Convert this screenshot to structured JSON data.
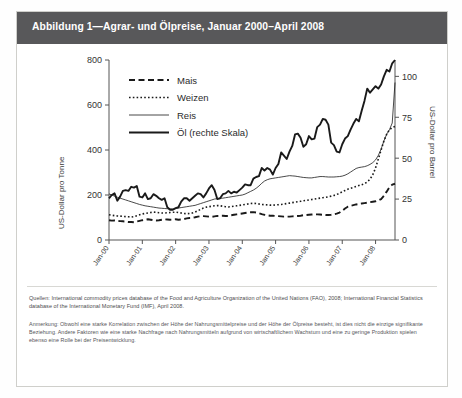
{
  "figure": {
    "title": "Abbildung 1—Agrar- und Ölpreise, Januar 2000–April 2008",
    "source_label": "Quellen:",
    "source_text": "Quellen:  International commodity prices database of the Food and Agriculture Organization of the United Nations (FAO), 2008; International Financial Statistics database of the International Monetary Fund (IMF), April 2008.",
    "note_text": "Anmerkung:  Obwohl eine starke Korrelation zwischen der Höhe der Nahrungsmittelpreise und der Höhe der Ölpreise besteht, ist dies nicht die einzige signifikante Beziehung. Andere Faktoren wie eine starke Nachfrage nach Nahrungsmitteln aufgrund von wirtschaftlichem Wachstum und eine zu geringe Produktion spielen ebenso eine Rolle bei der Preisentwicklung."
  },
  "chart_data": {
    "type": "line",
    "title": "Abbildung 1—Agrar- und Ölpreise, Januar 2000–April 2008",
    "xlabel": "",
    "ylabel": "US-Dollar pro Tonne",
    "y2label": "US-Dollar pro Barrel",
    "ylim": [
      0,
      800
    ],
    "y2lim": [
      0,
      110
    ],
    "yticks": [
      0,
      200,
      400,
      600,
      800
    ],
    "y2ticks": [
      0,
      25,
      50,
      75,
      100
    ],
    "grid": false,
    "legend_position": "top-left",
    "x_tick_labels": [
      "Jan-00",
      "Jan-01",
      "Jan-02",
      "Jan-03",
      "Jan-04",
      "Jan-05",
      "Jan-06",
      "Jan-07",
      "Jan-08"
    ],
    "x_start": "Jan-00",
    "x_end": "Apr-08",
    "series": [
      {
        "name": "Mais",
        "style": "dashed",
        "axis": "left",
        "unit": "US-Dollar pro Tonne",
        "values": [
          88,
          86,
          87,
          85,
          84,
          83,
          82,
          80,
          80,
          79,
          82,
          85,
          88,
          90,
          92,
          90,
          88,
          87,
          88,
          90,
          92,
          91,
          90,
          91,
          92,
          90,
          91,
          93,
          96,
          98,
          99,
          101,
          104,
          106,
          106,
          105,
          104,
          103,
          105,
          107,
          108,
          108,
          107,
          107,
          110,
          112,
          114,
          116,
          118,
          120,
          122,
          123,
          124,
          122,
          119,
          115,
          112,
          110,
          108,
          108,
          107,
          106,
          105,
          104,
          104,
          104,
          105,
          106,
          107,
          108,
          110,
          111,
          112,
          113,
          114,
          114,
          113,
          112,
          111,
          111,
          112,
          114,
          117,
          122,
          130,
          140,
          148,
          152,
          155,
          158,
          160,
          162,
          164,
          166,
          168,
          170,
          172,
          176,
          182,
          196,
          215,
          235,
          246,
          250
        ]
      },
      {
        "name": "Weizen",
        "style": "dotted",
        "axis": "left",
        "unit": "US-Dollar pro Tonne",
        "values": [
          112,
          110,
          108,
          107,
          106,
          105,
          104,
          103,
          102,
          104,
          108,
          112,
          116,
          118,
          120,
          122,
          124,
          123,
          121,
          120,
          120,
          121,
          122,
          123,
          124,
          122,
          120,
          118,
          117,
          118,
          120,
          124,
          130,
          136,
          142,
          146,
          148,
          150,
          152,
          153,
          152,
          150,
          148,
          147,
          148,
          150,
          152,
          154,
          156,
          158,
          160,
          162,
          163,
          162,
          160,
          158,
          157,
          156,
          155,
          155,
          156,
          157,
          158,
          160,
          162,
          164,
          166,
          168,
          170,
          172,
          174,
          176,
          178,
          180,
          182,
          184,
          186,
          188,
          190,
          192,
          195,
          198,
          202,
          208,
          214,
          220,
          226,
          230,
          234,
          238,
          242,
          246,
          250,
          258,
          270,
          290,
          320,
          360,
          400,
          440,
          470,
          490,
          500,
          505
        ]
      },
      {
        "name": "Reis",
        "style": "thin-solid",
        "axis": "left",
        "unit": "US-Dollar pro Tonne",
        "values": [
          205,
          200,
          195,
          190,
          186,
          182,
          178,
          174,
          170,
          166,
          162,
          158,
          155,
          152,
          150,
          148,
          146,
          144,
          142,
          141,
          140,
          139,
          138,
          138,
          140,
          142,
          144,
          146,
          148,
          150,
          152,
          154,
          158,
          162,
          166,
          170,
          174,
          178,
          182,
          184,
          185,
          186,
          188,
          190,
          192,
          194,
          196,
          198,
          200,
          204,
          210,
          216,
          222,
          230,
          240,
          252,
          262,
          268,
          272,
          274,
          276,
          278,
          280,
          282,
          284,
          286,
          285,
          284,
          282,
          280,
          278,
          277,
          276,
          276,
          278,
          280,
          282,
          282,
          281,
          280,
          280,
          280,
          281,
          282,
          284,
          288,
          294,
          302,
          310,
          318,
          322,
          324,
          326,
          330,
          336,
          344,
          356,
          376,
          404,
          440,
          470,
          490,
          520,
          700
        ]
      },
      {
        "name": "Öl (rechte Skala)",
        "style": "thick-solid",
        "axis": "right",
        "unit": "US-Dollar pro Barrel",
        "values": [
          25.5,
          27.5,
          28.5,
          24.0,
          26.5,
          30.0,
          30.5,
          30.0,
          32.5,
          32.0,
          33.0,
          26.5,
          26.0,
          28.5,
          25.0,
          25.5,
          28.0,
          27.0,
          25.5,
          24.5,
          25.5,
          20.0,
          18.5,
          18.5,
          19.5,
          20.0,
          23.5,
          25.5,
          25.5,
          24.0,
          25.5,
          27.0,
          28.5,
          28.0,
          26.0,
          28.5,
          31.5,
          33.5,
          30.5,
          25.0,
          25.5,
          28.0,
          28.5,
          30.0,
          28.5,
          29.5,
          29.0,
          30.5,
          32.0,
          34.0,
          33.5,
          33.5,
          37.5,
          38.5,
          39.0,
          44.0,
          42.5,
          44.0,
          43.0,
          40.0,
          44.0,
          46.5,
          53.5,
          51.5,
          49.5,
          54.0,
          57.5,
          64.5,
          65.0,
          62.5,
          57.0,
          58.5,
          63.5,
          61.5,
          62.0,
          69.0,
          70.5,
          74.0,
          73.5,
          70.5,
          59.5,
          58.0,
          54.0,
          53.5,
          58.5,
          62.0,
          63.5,
          67.5,
          71.0,
          74.0,
          72.5,
          79.0,
          85.0,
          92.5,
          90.0,
          92.0,
          94.0,
          92.5,
          95.0,
          100.0,
          104.0,
          103.0,
          108.0,
          110.0
        ]
      }
    ]
  },
  "axes": {
    "left_title": "US-Dollar pro Tonne",
    "right_title": "US-Dollar pro Barrel",
    "left_ticks": [
      "0",
      "200",
      "400",
      "600",
      "800"
    ],
    "right_ticks": [
      "0",
      "25",
      "50",
      "75",
      "100"
    ],
    "x_ticks": [
      "Jan-00",
      "Jan-01",
      "Jan-02",
      "Jan-03",
      "Jan-04",
      "Jan-05",
      "Jan-06",
      "Jan-07",
      "Jan-08"
    ]
  },
  "legend": {
    "items": [
      {
        "label": "Mais",
        "style": "dashed"
      },
      {
        "label": "Weizen",
        "style": "dotted"
      },
      {
        "label": "Reis",
        "style": "thin-solid"
      },
      {
        "label": "Öl (rechte Skala)",
        "style": "thick-solid"
      }
    ]
  },
  "colors": {
    "title_bar": "#58585a",
    "title_text": "#ffffff",
    "line": "#1a1a1a",
    "axis": "#555555",
    "box_border": "#cfcfcb"
  }
}
